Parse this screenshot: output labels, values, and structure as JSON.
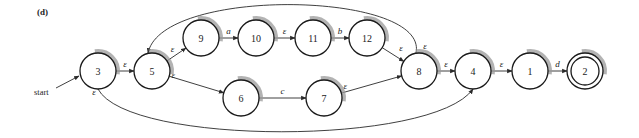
{
  "panel_label": "(d)",
  "start_label": "start",
  "start_state": "3",
  "accepting_states": [
    "2"
  ],
  "nodes": [
    {
      "id": "3",
      "label": "3",
      "x": 98,
      "y": 71
    },
    {
      "id": "5",
      "label": "5",
      "x": 152,
      "y": 71
    },
    {
      "id": "9",
      "label": "9",
      "x": 201,
      "y": 38
    },
    {
      "id": "10",
      "label": "10",
      "x": 256,
      "y": 38
    },
    {
      "id": "11",
      "label": "11",
      "x": 313,
      "y": 38
    },
    {
      "id": "12",
      "label": "12",
      "x": 367,
      "y": 38
    },
    {
      "id": "6",
      "label": "6",
      "x": 241,
      "y": 98
    },
    {
      "id": "7",
      "label": "7",
      "x": 324,
      "y": 98
    },
    {
      "id": "8",
      "label": "8",
      "x": 419,
      "y": 71
    },
    {
      "id": "4",
      "label": "4",
      "x": 473,
      "y": 71
    },
    {
      "id": "1",
      "label": "1",
      "x": 530,
      "y": 71
    },
    {
      "id": "2",
      "label": "2",
      "x": 585,
      "y": 71
    }
  ],
  "edges": [
    {
      "from": "3",
      "to": "5",
      "label": "ε"
    },
    {
      "from": "5",
      "to": "9",
      "label": "ε"
    },
    {
      "from": "9",
      "to": "10",
      "label": "a"
    },
    {
      "from": "10",
      "to": "11",
      "label": "ε"
    },
    {
      "from": "11",
      "to": "12",
      "label": "b"
    },
    {
      "from": "12",
      "to": "8",
      "label": "ε"
    },
    {
      "from": "5",
      "to": "6",
      "label": "ε"
    },
    {
      "from": "6",
      "to": "7",
      "label": "c"
    },
    {
      "from": "7",
      "to": "8",
      "label": "ε"
    },
    {
      "from": "8",
      "to": "5",
      "label": "ε"
    },
    {
      "from": "8",
      "to": "4",
      "label": "ε"
    },
    {
      "from": "3",
      "to": "4",
      "label": "ε"
    },
    {
      "from": "4",
      "to": "1",
      "label": "ε"
    },
    {
      "from": "1",
      "to": "2",
      "label": "d"
    }
  ]
}
